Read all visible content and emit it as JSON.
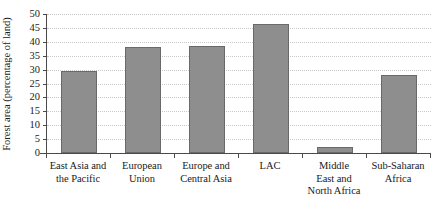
{
  "chart_data": {
    "type": "bar",
    "title": "",
    "xlabel": "",
    "ylabel": "Forest area (percentage of land)",
    "ylim": [
      0,
      50
    ],
    "ytick_step": 5,
    "grid": true,
    "legend": false,
    "bar_color": "#8e8e8e",
    "bar_border_color": "#6a6a6a",
    "axis_color": "#4a4a4a",
    "gridline_color": "#c9c9c9",
    "background_color": "#ffffff",
    "categories": [
      "East Asia and\nthe Pacific",
      "European\nUnion",
      "Europe and\nCentral Asia",
      "LAC",
      "Middle\nEast and\nNorth Africa",
      "Sub-Saharan\nAfrica"
    ],
    "values": [
      29.5,
      38.2,
      38.5,
      46.5,
      2.2,
      28.0
    ],
    "ytick_labels": [
      "0",
      "5",
      "10",
      "15",
      "20",
      "25",
      "30",
      "35",
      "40",
      "45",
      "50"
    ],
    "ytick_values": [
      0,
      5,
      10,
      15,
      20,
      25,
      30,
      35,
      40,
      45,
      50
    ]
  }
}
